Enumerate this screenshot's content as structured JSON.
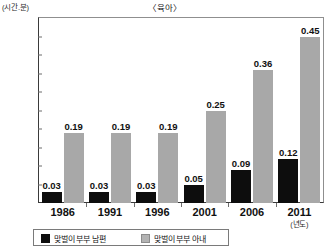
{
  "chart_data": {
    "type": "bar",
    "title": "〈육아〉",
    "xlabel": "(년도)",
    "ylabel": "(시간.분)",
    "categories": [
      "1986",
      "1991",
      "1996",
      "2001",
      "2006",
      "2011"
    ],
    "series": [
      {
        "name": "맞벌이 부부 남편",
        "color": "#0d0d0d",
        "values": [
          0.03,
          0.03,
          0.03,
          0.05,
          0.09,
          0.12
        ],
        "labels": [
          "0.03",
          "0.03",
          "0.03",
          "0.05",
          "0.09",
          "0.12"
        ]
      },
      {
        "name": "맞벌이 부부 아내",
        "color": "#a8a8a8",
        "values": [
          0.19,
          0.19,
          0.19,
          0.25,
          0.36,
          0.45
        ],
        "labels": [
          "0.19",
          "0.19",
          "0.19",
          "0.25",
          "0.36",
          "0.45"
        ]
      }
    ],
    "ylim": [
      0,
      0.5
    ],
    "yticks": [
      0,
      0.05,
      0.1,
      0.15,
      0.2,
      0.25,
      0.3,
      0.35,
      0.4,
      0.45,
      0.5
    ],
    "ytick_labels": [
      "0",
      "0.05",
      "0.1",
      "0.15",
      "0.2",
      "0.25",
      "0.3",
      "0.35",
      "0.4",
      "0.45",
      "0.5"
    ],
    "grid": false,
    "legend_position": "bottom"
  },
  "legend": {
    "items": [
      {
        "label": "맞벌이 부부 남편"
      },
      {
        "label": "맞벌이 부부 아내"
      }
    ]
  }
}
